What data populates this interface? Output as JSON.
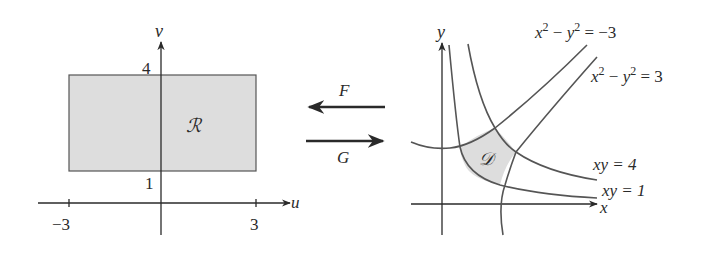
{
  "left_panel": {
    "axis_labels": {
      "horizontal": "u",
      "vertical": "v"
    },
    "ticks": {
      "u_neg": "−3",
      "u_pos": "3",
      "v_low": "1",
      "v_high": "4"
    },
    "region_label": "ℛ",
    "region": {
      "u_range": [
        -3,
        3
      ],
      "v_range": [
        1,
        4
      ],
      "fill": "#dddddd"
    }
  },
  "middle": {
    "map_F": {
      "label": "F",
      "direction": "right-to-left"
    },
    "map_G": {
      "label": "G",
      "direction": "left-to-right"
    }
  },
  "right_panel": {
    "axis_labels": {
      "horizontal": "x",
      "vertical": "y"
    },
    "region_label": "𝒟",
    "curves": [
      {
        "id": "hyperbola-neg3",
        "label": "x² − y² = −3",
        "lhs": "x",
        "sup1": "2",
        "mid": " − y",
        "sup2": "2",
        "rhs": " = −3"
      },
      {
        "id": "hyperbola-pos3",
        "label": "x² − y² = 3",
        "lhs": "x",
        "sup1": "2",
        "mid": " − y",
        "sup2": "2",
        "rhs": " = 3"
      },
      {
        "id": "xy-4",
        "label": "xy = 4"
      },
      {
        "id": "xy-1",
        "label": "xy = 1"
      }
    ],
    "region_fill": "#dddddd"
  }
}
